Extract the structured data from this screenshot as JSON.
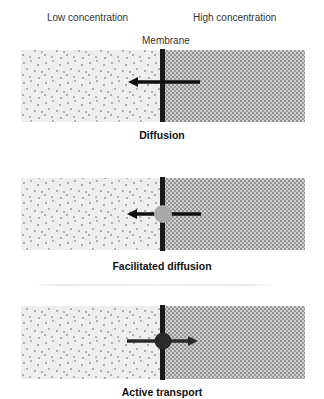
{
  "header": {
    "low_label": "Low concentration",
    "high_label": "High concentration",
    "membrane_label": "Membrane"
  },
  "panels": [
    {
      "caption": "Diffusion",
      "carrier": "none",
      "arrow_direction": "left (high to low)"
    },
    {
      "caption": "Facilitated diffusion",
      "carrier": "light-gray protein channel",
      "arrow_direction": "left (high to low)"
    },
    {
      "caption": "Active transport",
      "carrier": "dark protein pump",
      "arrow_direction": "right (low to high)"
    }
  ],
  "colors": {
    "low_bg": "#eeeeee",
    "high_bg": "#c9c9c9",
    "dot": "#555555",
    "membrane": "#1a1a1a",
    "facilitated_carrier": "#a9a9a9",
    "active_carrier": "#2a2a2a"
  }
}
